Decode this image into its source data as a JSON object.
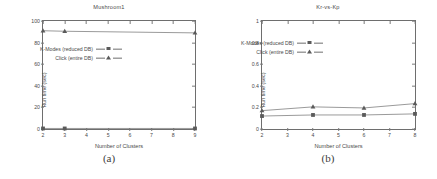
{
  "figure": {
    "caption_a": "(a)",
    "caption_b": "(b)"
  },
  "panels": [
    {
      "title": "Mushroom1",
      "xlabel": "Number of Clusters",
      "ylabel": "Run time (sec)",
      "caption": "(a)",
      "xticks": [
        "2",
        "3",
        "4",
        "5",
        "6",
        "7",
        "8",
        "9"
      ],
      "yticks": [
        "0",
        "20",
        "40",
        "60",
        "80",
        "100"
      ],
      "legend": [
        {
          "label": "K-Modes (reduced DB)",
          "marker": "square"
        },
        {
          "label": "Click (entire DB)",
          "marker": "triangle"
        }
      ]
    },
    {
      "title": "Kr-vs-Kp",
      "xlabel": "Number of Clusters",
      "ylabel": "Run time (sec)",
      "caption": "(b)",
      "xticks": [
        "2",
        "3",
        "4",
        "5",
        "6",
        "7",
        "8"
      ],
      "yticks": [
        "0",
        "0.2",
        "0.4",
        "0.6",
        "0.8",
        "1"
      ],
      "legend": [
        {
          "label": "K-Modes (reduced DB)",
          "marker": "square"
        },
        {
          "label": "Click (entire DB)",
          "marker": "triangle"
        }
      ]
    }
  ],
  "chart_data": [
    {
      "type": "line",
      "title": "Mushroom1",
      "xlabel": "Number of Clusters",
      "ylabel": "Run time (sec)",
      "xlim": [
        2,
        9
      ],
      "ylim": [
        0,
        100
      ],
      "xticks": [
        2,
        3,
        4,
        5,
        6,
        7,
        8,
        9
      ],
      "yticks": [
        0,
        20,
        40,
        60,
        80,
        100
      ],
      "grid": false,
      "legend_position": "center",
      "x": [
        2,
        3,
        9
      ],
      "series": [
        {
          "name": "K-Modes (reduced DB)",
          "marker": "square",
          "values": [
            0.5,
            0.5,
            0.5
          ]
        },
        {
          "name": "Click (entire DB)",
          "marker": "triangle",
          "values": [
            91,
            90.5,
            89
          ]
        }
      ]
    },
    {
      "type": "line",
      "title": "Kr-vs-Kp",
      "xlabel": "Number of Clusters",
      "ylabel": "Run time (sec)",
      "xlim": [
        2,
        8
      ],
      "ylim": [
        0,
        1
      ],
      "xticks": [
        2,
        3,
        4,
        5,
        6,
        7,
        8
      ],
      "yticks": [
        0,
        0.2,
        0.4,
        0.6,
        0.8,
        1
      ],
      "grid": false,
      "legend_position": "center-left",
      "x": [
        2,
        4,
        6,
        8
      ],
      "series": [
        {
          "name": "K-Modes (reduced DB)",
          "marker": "square",
          "values": [
            0.12,
            0.13,
            0.13,
            0.14
          ]
        },
        {
          "name": "Click (entire DB)",
          "marker": "triangle",
          "values": [
            0.17,
            0.205,
            0.195,
            0.235
          ]
        }
      ]
    }
  ]
}
